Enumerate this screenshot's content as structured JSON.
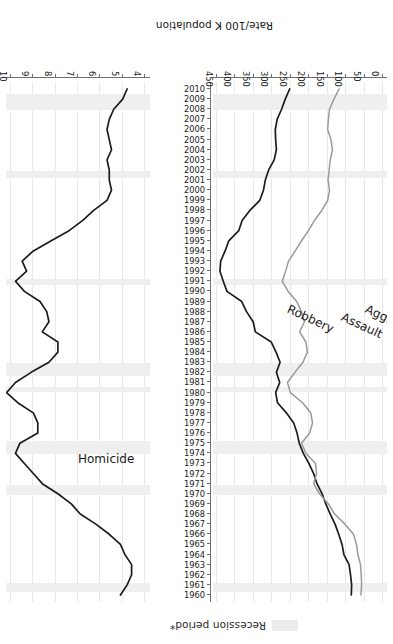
{
  "legend": {
    "label": "Recession period*",
    "swatch_color": "#ececec"
  },
  "axes": {
    "year_axis": {
      "label": "",
      "min": 1960,
      "max": 2010,
      "ticks": [
        1960,
        1961,
        1962,
        1963,
        1964,
        1965,
        1966,
        1967,
        1968,
        1969,
        1970,
        1971,
        1972,
        1973,
        1974,
        1975,
        1976,
        1977,
        1978,
        1979,
        1980,
        1981,
        1982,
        1983,
        1984,
        1985,
        1986,
        1987,
        1988,
        1989,
        1990,
        1991,
        1992,
        1993,
        1994,
        1995,
        1996,
        1997,
        1998,
        1999,
        2000,
        2001,
        2002,
        2003,
        2004,
        2005,
        2006,
        2007,
        2008,
        2009,
        2010
      ]
    },
    "rate_axis_left": {
      "ticks": [
        0,
        50,
        100,
        150,
        200,
        250,
        300,
        350,
        400,
        450
      ],
      "min": 0,
      "max": 450
    },
    "rate_axis_right": {
      "ticks": [
        4,
        5,
        6,
        7,
        8,
        9,
        10
      ],
      "min": 4,
      "max": 10
    },
    "title": "Rate/100 K population"
  },
  "series_labels": {
    "aggravated_assault": "Aggravated\nAssault",
    "aggravated_assault_line1": "Aggravated",
    "aggravated_assault_line2": "Assault",
    "robbery": "Robbery",
    "homicide": "Homicide"
  },
  "colors": {
    "aggravated_assault": "#1c1c1c",
    "robbery": "#9a9a9a",
    "homicide": "#1c1c1c",
    "recession": "#efefef",
    "grid": "#e8e8e8",
    "axis": "#707070"
  },
  "chart_data": {
    "type": "line",
    "title": "",
    "subtitle": "",
    "xlabel": "",
    "ylabel": "Rate/100 K population",
    "orientation": "rotated-180",
    "grid": true,
    "legend_position": "top",
    "x": [
      1960,
      1961,
      1962,
      1963,
      1964,
      1965,
      1966,
      1967,
      1968,
      1969,
      1970,
      1971,
      1972,
      1973,
      1974,
      1975,
      1976,
      1977,
      1978,
      1979,
      1980,
      1981,
      1982,
      1983,
      1984,
      1985,
      1986,
      1987,
      1988,
      1989,
      1990,
      1991,
      1992,
      1993,
      1994,
      1995,
      1996,
      1997,
      1998,
      1999,
      2000,
      2001,
      2002,
      2003,
      2004,
      2005,
      2006,
      2007,
      2008,
      2009,
      2010
    ],
    "xlim": [
      1960,
      2010
    ],
    "ylim_left": [
      0,
      450
    ],
    "ylim_right": [
      4,
      10
    ],
    "series": [
      {
        "name": "Aggravated Assault",
        "axis": "left",
        "color": "#1c1c1c",
        "values": [
          86,
          85,
          88,
          92,
          106,
          111,
          120,
          130,
          143,
          155,
          165,
          179,
          188,
          201,
          216,
          227,
          233,
          242,
          262,
          286,
          291,
          280,
          289,
          279,
          290,
          303,
          346,
          352,
          370,
          383,
          423,
          433,
          442,
          440,
          428,
          418,
          391,
          382,
          361,
          334,
          324,
          319,
          310,
          295,
          289,
          291,
          292,
          287,
          275,
          265,
          253
        ]
      },
      {
        "name": "Robbery",
        "axis": "left",
        "color": "#9a9a9a",
        "values": [
          60,
          58,
          59,
          61,
          68,
          72,
          80,
          103,
          131,
          148,
          172,
          188,
          180,
          183,
          209,
          221,
          199,
          191,
          196,
          218,
          251,
          259,
          239,
          217,
          205,
          209,
          226,
          213,
          221,
          234,
          257,
          273,
          264,
          256,
          238,
          221,
          202,
          186,
          166,
          150,
          145,
          149,
          146,
          143,
          137,
          141,
          150,
          148,
          145,
          133,
          119
        ]
      },
      {
        "name": "Homicide",
        "axis": "right",
        "color": "#1c1c1c",
        "values": [
          5.1,
          4.8,
          4.6,
          4.6,
          4.9,
          5.1,
          5.6,
          6.2,
          6.9,
          7.3,
          7.9,
          8.6,
          9.0,
          9.4,
          9.8,
          9.6,
          8.8,
          8.8,
          9.0,
          9.7,
          10.2,
          9.8,
          9.1,
          8.3,
          7.9,
          7.9,
          8.6,
          8.3,
          8.4,
          8.7,
          9.4,
          9.8,
          9.3,
          9.5,
          9.0,
          8.2,
          7.4,
          6.8,
          6.3,
          5.7,
          5.5,
          5.6,
          5.6,
          5.7,
          5.5,
          5.6,
          5.7,
          5.6,
          5.4,
          5.0,
          4.8
        ]
      }
    ],
    "recession_periods": [
      [
        1960.3,
        1961.2
      ],
      [
        1969.9,
        1970.9
      ],
      [
        1973.9,
        1975.2
      ],
      [
        1980.1,
        1980.6
      ],
      [
        1981.6,
        1982.9
      ],
      [
        1990.6,
        1991.2
      ],
      [
        2001.2,
        2001.9
      ],
      [
        2007.9,
        2009.5
      ]
    ]
  }
}
